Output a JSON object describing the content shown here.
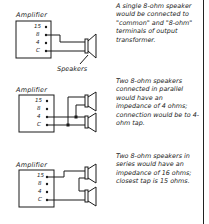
{
  "diagrams": [
    {
      "amplifier_label": "Amplifier",
      "terminals": [
        "15",
        "8",
        "4",
        "C"
      ],
      "callout": "Speakers",
      "caption": "A single 8-ohm speaker would be connected to \"common\" and \"8-ohm\" terminals of output transformer."
    },
    {
      "amplifier_label": "Amplifier",
      "terminals": [
        "15",
        "8",
        "4",
        "C"
      ],
      "caption": "Two 8-ohm speakers connected in parallel would have an impedance of 4 ohms; connection would be to 4-ohm tap."
    },
    {
      "amplifier_label": "Amplifier",
      "terminals": [
        "15",
        "8",
        "4",
        "C"
      ],
      "caption": "Two 8-ohm speakers in series would have an impedance of 16 ohms; closest tap is 15 ohms."
    }
  ],
  "colors": {
    "ink": "#1a1a1a",
    "background": "#ffffff"
  }
}
